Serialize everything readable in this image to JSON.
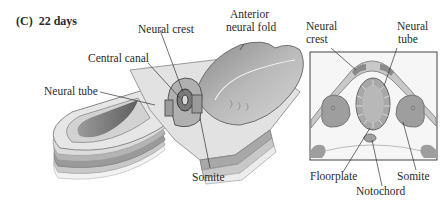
{
  "figure": {
    "panel_label": "(C)",
    "panel_title": "22 days",
    "left_view": {
      "description": "3D cutaway of embryo",
      "labels": {
        "neural_crest": "Neural crest",
        "anterior_neural_fold_line1": "Anterior",
        "anterior_neural_fold_line2": "neural fold",
        "central_canal": "Central canal",
        "neural_tube": "Neural tube",
        "somite": "Somite"
      }
    },
    "right_view": {
      "description": "Transverse cross-section",
      "labels": {
        "neural_crest_line1": "Neural",
        "neural_crest_line2": "crest",
        "neural_tube_line1": "Neural",
        "neural_tube_line2": "tube",
        "floorplate": "Floorplate",
        "notochord": "Notochord",
        "somite": "Somite"
      }
    }
  }
}
